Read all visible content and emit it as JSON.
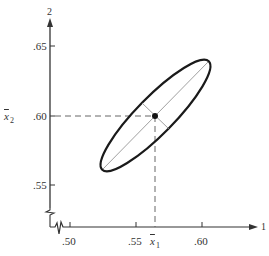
{
  "axes": {
    "x_axis_label": "1",
    "y_axis_label": "2",
    "x_ticks": [
      ".50",
      ".55",
      ".60"
    ],
    "y_ticks": [
      ".65",
      ".60",
      ".55"
    ],
    "x_mean_label": "x",
    "x_mean_sub": "1",
    "y_mean_label": "x",
    "y_mean_sub": "2"
  },
  "ellipse": {
    "center": [
      0.565,
      0.6
    ],
    "description": "Confidence ellipse centered at sample mean with major and minor axes drawn"
  },
  "colors": {
    "ellipse": "#1a1a1a",
    "axes": "#333333",
    "guides": "#555555"
  }
}
